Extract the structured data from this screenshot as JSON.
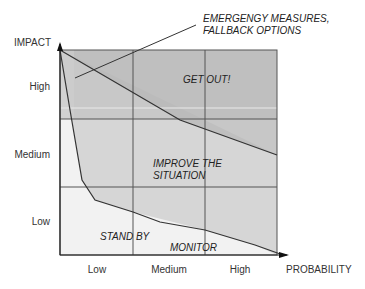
{
  "diagram": {
    "y_axis_title": "IMPACT",
    "x_axis_title": "PROBABILITY",
    "y_levels": [
      "High",
      "Medium",
      "Low"
    ],
    "x_levels": [
      "Low",
      "Medium",
      "High"
    ],
    "annotation": [
      "EMERGENGY MEASURES,",
      "FALLBACK OPTIONS"
    ],
    "zones": {
      "get_out": "GET OUT!",
      "improve": [
        "IMPROVE THE",
        "SITUATION"
      ],
      "stand_by": "STAND BY",
      "monitor": "MONITOR"
    },
    "colors": {
      "dark_band": "#bdbdbd",
      "mid_zone": "#d6d6d6",
      "light_zone": "#f2f2f2",
      "emergency_strip": "#cfcfcf",
      "line": "#333333"
    }
  }
}
